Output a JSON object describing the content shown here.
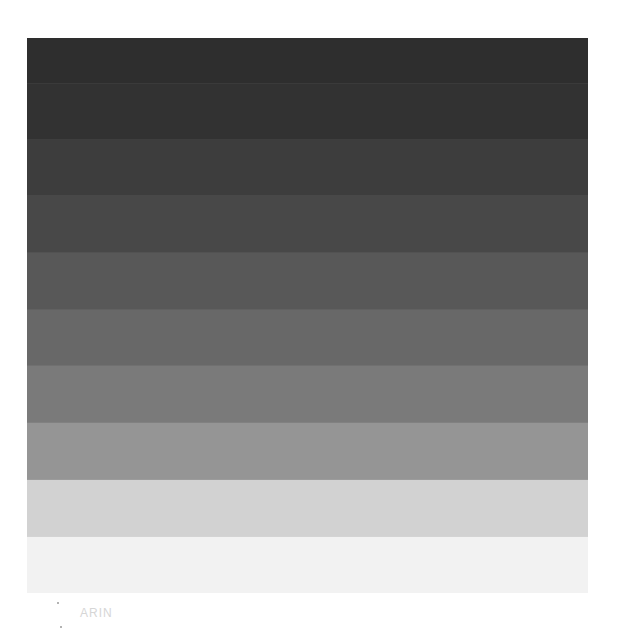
{
  "chart_data": {
    "type": "heatmap",
    "title": "",
    "xlabel": "",
    "ylabel": "",
    "orientation": "vertical-steps",
    "categories": [
      "Step 1",
      "Step 2",
      "Step 3",
      "Step 4",
      "Step 5",
      "Step 6",
      "Step 7",
      "Step 8",
      "Step 9",
      "Step 10"
    ],
    "values": [
      46,
      50,
      61,
      72,
      88,
      104,
      122,
      149,
      210,
      242
    ],
    "colors": [
      "#2e2e2e",
      "#323232",
      "#3d3d3d",
      "#484848",
      "#585858",
      "#686868",
      "#7a7a7a",
      "#959595",
      "#d2d2d2",
      "#f2f2f2"
    ],
    "band_heights_px": [
      46,
      56,
      56,
      57,
      57,
      56,
      57,
      57,
      57,
      56
    ],
    "grid": false,
    "legend": "none"
  },
  "caption": {
    "text": "ARIN"
  }
}
